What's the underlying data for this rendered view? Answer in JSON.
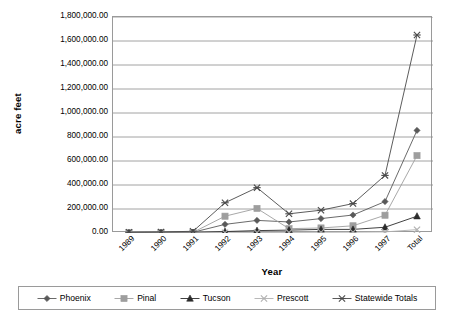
{
  "chart_data": {
    "type": "line",
    "title": "",
    "xlabel": "Year",
    "ylabel": "acre feet",
    "categories": [
      "1989",
      "1990",
      "1991",
      "1992",
      "1993",
      "1994",
      "1995",
      "1996",
      "1997",
      "Total"
    ],
    "ylim": [
      0,
      1800000
    ],
    "ytick_values": [
      0,
      200000,
      400000,
      600000,
      800000,
      1000000,
      1200000,
      1400000,
      1600000,
      1800000
    ],
    "ytick_labels": [
      "0.00",
      "200,000.00",
      "400,000.00",
      "600,000.00",
      "800,000.00",
      "1,000,000.00",
      "1,200,000.00",
      "1,400,000.00",
      "1,600,000.00",
      "1,800,000.00"
    ],
    "grid": true,
    "grid_axis": "y",
    "legend_position": "bottom",
    "series": [
      {
        "name": "Phoenix",
        "marker": "diamond",
        "color": "#595959",
        "values": [
          3000,
          4000,
          6000,
          72000,
          105000,
          92000,
          120000,
          150000,
          262000,
          855000
        ]
      },
      {
        "name": "Pinal",
        "marker": "square",
        "color": "#9e9e9e",
        "values": [
          2000,
          3000,
          5000,
          140000,
          205000,
          36000,
          42000,
          60000,
          148000,
          645000
        ]
      },
      {
        "name": "Tucson",
        "marker": "triangle",
        "color": "#2b2b2b",
        "values": [
          1000,
          2000,
          4000,
          12000,
          20000,
          24000,
          30000,
          30000,
          48000,
          140000
        ]
      },
      {
        "name": "Prescott",
        "marker": "cross",
        "color": "#b0b0b0",
        "values": [
          1000,
          1000,
          2000,
          3000,
          4000,
          5000,
          6000,
          7000,
          9000,
          28000
        ]
      },
      {
        "name": "Statewide Totals",
        "marker": "asterisk",
        "color": "#4a4a4a",
        "values": [
          6000,
          9000,
          14000,
          252000,
          378000,
          160000,
          190000,
          245000,
          480000,
          1650000
        ]
      }
    ]
  },
  "axes": {
    "y_title": "acre feet",
    "x_title": "Year"
  }
}
